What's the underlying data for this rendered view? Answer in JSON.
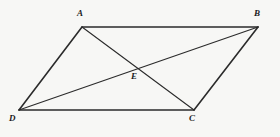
{
  "figure": {
    "kind": "parallelogram-with-diagonals",
    "background_color": "#f7f7f5",
    "stroke_color": "#2b2b2b",
    "label_color": "#1b1b1b",
    "side_stroke_width": 1.6,
    "diagonal_stroke_width": 1.1,
    "labels": {
      "a": "A",
      "b": "B",
      "c": "C",
      "d": "D",
      "e": "E"
    },
    "points": {
      "A": {
        "x": 82,
        "y": 27
      },
      "B": {
        "x": 258,
        "y": 27
      },
      "C": {
        "x": 194,
        "y": 110
      },
      "D": {
        "x": 19,
        "y": 110
      },
      "E": {
        "x": 138,
        "y": 68.5
      }
    },
    "segments": [
      {
        "name": "side-AB",
        "from": "A",
        "to": "B",
        "role": "side"
      },
      {
        "name": "side-BC",
        "from": "B",
        "to": "C",
        "role": "side"
      },
      {
        "name": "side-CD",
        "from": "C",
        "to": "D",
        "role": "side"
      },
      {
        "name": "side-DA",
        "from": "D",
        "to": "A",
        "role": "side"
      },
      {
        "name": "diagonal-AC",
        "from": "A",
        "to": "C",
        "role": "diagonal"
      },
      {
        "name": "diagonal-DB",
        "from": "D",
        "to": "B",
        "role": "diagonal"
      }
    ]
  }
}
